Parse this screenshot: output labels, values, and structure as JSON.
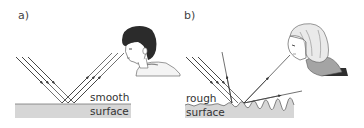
{
  "panels": [
    {
      "id": "a",
      "label": "a)",
      "surface_type": "smooth",
      "surface_label_line1": "smooth",
      "surface_label_line2": "surface",
      "observer": "boy viewing reflected rays",
      "description": "Parallel incident rays reflect as parallel rays (regular reflection)"
    },
    {
      "id": "b",
      "label": "b)",
      "surface_type": "rough",
      "surface_label_line1": "rough",
      "surface_label_line2": "surface",
      "observer": "woman viewing scattered ray",
      "description": "Parallel incident rays scatter in different directions (diffuse reflection)"
    }
  ],
  "colors": {
    "ray": "#333333",
    "surface_fill": "#d4d4d4",
    "surface_edge": "#7a7a7a",
    "hair_dark": "#2a2a2a",
    "hair_light": "#e8e8e8",
    "shirt": "#9a9a9a",
    "skin": "#ffffff"
  }
}
